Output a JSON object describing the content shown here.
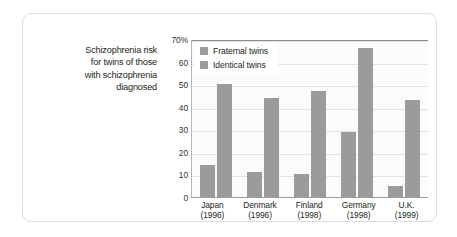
{
  "caption": {
    "lines": [
      "Schizophrenia risk",
      "for twins of those",
      "with schizophrenia",
      "diagnosed"
    ]
  },
  "legend": {
    "items": [
      {
        "label": "Fraternal twins",
        "color": "#9b9b9b"
      },
      {
        "label": "Identical twins",
        "color": "#9b9b9b"
      }
    ]
  },
  "yaxis": {
    "ticks": [
      "70%",
      "60",
      "50",
      "40",
      "30",
      "20",
      "10",
      "0"
    ]
  },
  "xaxis": {
    "categories": [
      {
        "name": "Japan",
        "year": "(1996)"
      },
      {
        "name": "Denmark",
        "year": "(1996)"
      },
      {
        "name": "Finland",
        "year": "(1998)"
      },
      {
        "name": "Germany",
        "year": "(1998)"
      },
      {
        "name": "U.K.",
        "year": "(1999)"
      }
    ]
  },
  "chart_data": {
    "type": "bar",
    "title": "Schizophrenia risk for twins of those with schizophrenia diagnosed",
    "xlabel": "",
    "ylabel": "",
    "ylim": [
      0,
      70
    ],
    "yticks": [
      0,
      10,
      20,
      30,
      40,
      50,
      60,
      70
    ],
    "ytick_labels": [
      "0",
      "10",
      "20",
      "30",
      "40",
      "50",
      "60",
      "70%"
    ],
    "grid": true,
    "legend_position": "top-left",
    "categories": [
      "Japan (1996)",
      "Denmark (1996)",
      "Finland (1998)",
      "Germany (1998)",
      "U.K. (1999)"
    ],
    "series": [
      {
        "name": "Fraternal twins",
        "color": "#9b9b9b",
        "values": [
          14,
          11,
          10,
          29,
          5
        ]
      },
      {
        "name": "Identical twins",
        "color": "#9b9b9b",
        "values": [
          50,
          44,
          47,
          66,
          43
        ]
      }
    ]
  },
  "style": {
    "bar_color": "#9b9b9b",
    "plot_bg": "#fbfbfb",
    "gridline_color": "#e3e3e3",
    "card_border": "#dcdcdc",
    "text_color": "#231f20"
  }
}
